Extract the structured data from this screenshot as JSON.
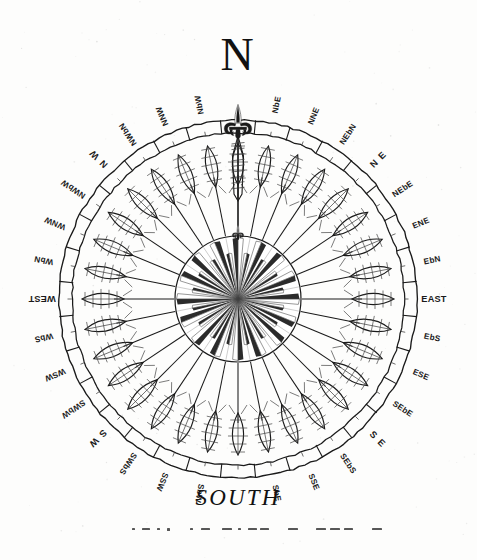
{
  "figure": {
    "kind": "compass-rose-engraving",
    "title_top": "N",
    "title_bottom": "SOUTH",
    "paper_color": "#fdfdfc",
    "ink_color": "#1a1a1a",
    "ink_light": "#444444",
    "center": {
      "x": 238,
      "y": 299
    },
    "radii": {
      "ring_outer": 179,
      "ring_inner": 166,
      "spoke_tip": 160,
      "star_circle": 63
    },
    "north_ornament": "fleur-de-lis-icon",
    "north_arrow": "feathered-arrow-icon",
    "spoke_count": 32,
    "star_points": 32
  },
  "points": [
    {
      "name": "N",
      "label": "",
      "bearing": 0,
      "style": "cardinal-top"
    },
    {
      "name": "NbE",
      "label": "NbE",
      "bearing": 11.25,
      "style": "point"
    },
    {
      "name": "NNE",
      "label": "NNE",
      "bearing": 22.5,
      "style": "point"
    },
    {
      "name": "NEbN",
      "label": "NEbN",
      "bearing": 33.75,
      "style": "point"
    },
    {
      "name": "NE",
      "label": "N E",
      "bearing": 45,
      "style": "ordinal"
    },
    {
      "name": "NEbE",
      "label": "NEbE",
      "bearing": 56.25,
      "style": "point"
    },
    {
      "name": "ENE",
      "label": "ENE",
      "bearing": 67.5,
      "style": "point"
    },
    {
      "name": "EbN",
      "label": "EbN",
      "bearing": 78.75,
      "style": "point"
    },
    {
      "name": "E",
      "label": "EAST",
      "bearing": 90,
      "style": "cardinal"
    },
    {
      "name": "EbS",
      "label": "EbS",
      "bearing": 101.25,
      "style": "point"
    },
    {
      "name": "ESE",
      "label": "ESE",
      "bearing": 112.5,
      "style": "point"
    },
    {
      "name": "SEbE",
      "label": "SEbE",
      "bearing": 123.75,
      "style": "point"
    },
    {
      "name": "SE",
      "label": "S E",
      "bearing": 135,
      "style": "ordinal"
    },
    {
      "name": "SEbS",
      "label": "SEbS",
      "bearing": 146.25,
      "style": "point"
    },
    {
      "name": "SSE",
      "label": "SSE",
      "bearing": 157.5,
      "style": "point"
    },
    {
      "name": "SbE",
      "label": "SbE",
      "bearing": 168.75,
      "style": "point"
    },
    {
      "name": "S",
      "label": "",
      "bearing": 180,
      "style": "cardinal-bottom"
    },
    {
      "name": "SbW",
      "label": "SbW",
      "bearing": 191.25,
      "style": "point"
    },
    {
      "name": "SSW",
      "label": "SSW",
      "bearing": 202.5,
      "style": "point"
    },
    {
      "name": "SWbS",
      "label": "SWbS",
      "bearing": 213.75,
      "style": "point"
    },
    {
      "name": "SW",
      "label": "S W",
      "bearing": 225,
      "style": "ordinal"
    },
    {
      "name": "SWbW",
      "label": "SWbW",
      "bearing": 236.25,
      "style": "point"
    },
    {
      "name": "WSW",
      "label": "WSW",
      "bearing": 247.5,
      "style": "point"
    },
    {
      "name": "WbS",
      "label": "WbS",
      "bearing": 258.75,
      "style": "point"
    },
    {
      "name": "W",
      "label": "WEST",
      "bearing": 270,
      "style": "cardinal"
    },
    {
      "name": "WbN",
      "label": "WbN",
      "bearing": 281.25,
      "style": "point"
    },
    {
      "name": "WNW",
      "label": "WNW",
      "bearing": 292.5,
      "style": "point"
    },
    {
      "name": "NWbW",
      "label": "NWbW",
      "bearing": 303.75,
      "style": "point"
    },
    {
      "name": "NW",
      "label": "N W",
      "bearing": 315,
      "style": "ordinal"
    },
    {
      "name": "NWbN",
      "label": "NWbN",
      "bearing": 326.25,
      "style": "point"
    },
    {
      "name": "NNW",
      "label": "NNW",
      "bearing": 337.5,
      "style": "point"
    },
    {
      "name": "NbW",
      "label": "NbW",
      "bearing": 348.75,
      "style": "point"
    }
  ],
  "footer_marks": {
    "description": "faint broken dash-and-dot remnants of a scanned caption line",
    "y": 528,
    "glyphs": [
      {
        "x": 132,
        "w": 3,
        "h": 2
      },
      {
        "x": 142,
        "w": 8,
        "h": 2
      },
      {
        "x": 157,
        "w": 3,
        "h": 2
      },
      {
        "x": 167,
        "w": 3,
        "h": 3
      },
      {
        "x": 190,
        "w": 3,
        "h": 2
      },
      {
        "x": 201,
        "w": 9,
        "h": 2
      },
      {
        "x": 222,
        "w": 10,
        "h": 2
      },
      {
        "x": 238,
        "w": 3,
        "h": 2
      },
      {
        "x": 248,
        "w": 9,
        "h": 2
      },
      {
        "x": 260,
        "w": 9,
        "h": 2
      },
      {
        "x": 288,
        "w": 10,
        "h": 2
      },
      {
        "x": 316,
        "w": 10,
        "h": 2
      },
      {
        "x": 330,
        "w": 10,
        "h": 2
      },
      {
        "x": 344,
        "w": 9,
        "h": 2
      },
      {
        "x": 372,
        "w": 10,
        "h": 2
      }
    ]
  }
}
